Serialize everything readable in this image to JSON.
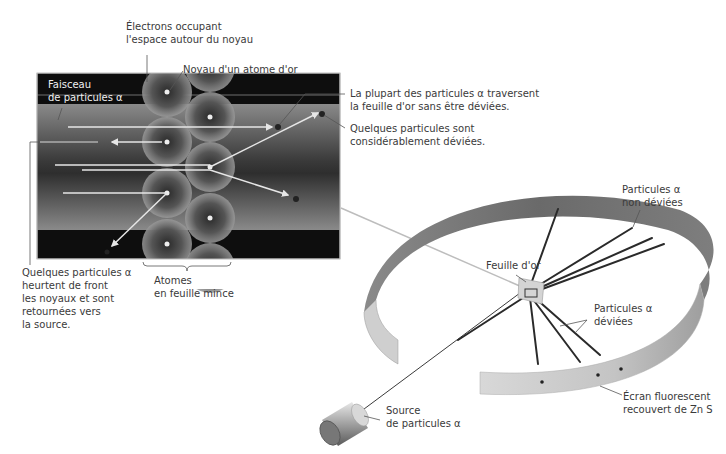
{
  "inset": {
    "labels": {
      "electrons": [
        "Électrons occupant",
        "l'espace autour du noyau"
      ],
      "nucleus": "Noyau d'un atome d'or",
      "beam": [
        "Faisceau",
        "de particules α"
      ],
      "most_pass": [
        "La plupart des particules α traversent",
        "la feuille d'or sans être déviées."
      ],
      "some_deflected": [
        "Quelques particules sont",
        "considérablement déviées."
      ],
      "head_on": [
        "Quelques particules α",
        "heurtent de front",
        "les noyaux et sont",
        "retournées vers",
        "la source."
      ],
      "atoms": [
        "Atomes",
        "en feuille mince"
      ]
    }
  },
  "apparatus": {
    "labels": {
      "undeflected": [
        "Particules α",
        "non déviées"
      ],
      "gold_foil": "Feuille d'or",
      "deflected": [
        "Particules α",
        "déviées"
      ],
      "screen": [
        "Écran fluorescent",
        "recouvert de Zn S"
      ],
      "source": [
        "Source",
        "de particules α"
      ]
    }
  },
  "colors": {
    "inset_dark": "#0e0e0e",
    "beam_gray": "#7a7a7a",
    "ring_dark": "#6e6e6e",
    "ring_light": "#cfcfcf",
    "track": "#2a2a2a",
    "label_text": "#3a3a3a"
  }
}
